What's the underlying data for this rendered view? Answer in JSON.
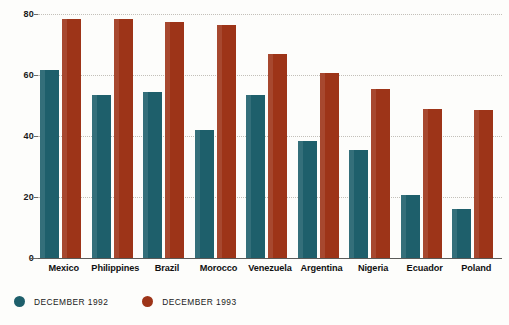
{
  "chart_data": {
    "type": "bar",
    "title": "",
    "xlabel": "",
    "ylabel": "",
    "ylim": [
      0,
      80
    ],
    "yticks": [
      0,
      20,
      40,
      60,
      80
    ],
    "grid": true,
    "legend_position": "bottom-left",
    "categories": [
      "Mexico",
      "Philippines",
      "Brazil",
      "Morocco",
      "Venezuela",
      "Argentina",
      "Nigeria",
      "Ecuador",
      "Poland"
    ],
    "series": [
      {
        "name": "DECEMBER 1992",
        "color": "#1e5f6b",
        "values": [
          61.5,
          53.5,
          54.5,
          42,
          53.5,
          38.5,
          35.5,
          20.5,
          16
        ]
      },
      {
        "name": "DECEMBER 1993",
        "color": "#9d3418",
        "values": [
          78.5,
          78.5,
          77.5,
          76.5,
          67,
          60.5,
          55.5,
          49,
          48.5
        ]
      }
    ]
  },
  "axis": {
    "tick_labels": [
      "80",
      "60",
      "40",
      "20",
      "0"
    ]
  },
  "legend": {
    "entries": [
      {
        "label": "DECEMBER 1992",
        "color": "#1e5f6b"
      },
      {
        "label": "DECEMBER 1993",
        "color": "#9d3418"
      }
    ]
  }
}
